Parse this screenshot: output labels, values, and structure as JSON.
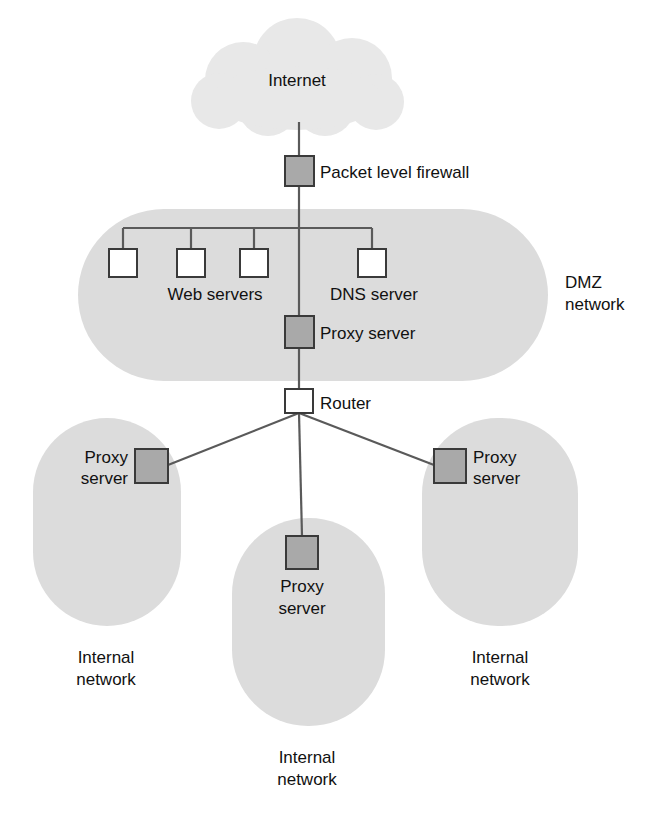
{
  "diagram": {
    "colors": {
      "zone_fill": "#dcdcdc",
      "cloud_fill": "#e8e8e8",
      "node_shaded_fill": "#a9a9a9",
      "node_white_fill": "#ffffff",
      "node_stroke": "#3a3a3a",
      "link_stroke": "#5a5a5a",
      "text": "#111111",
      "background": "#ffffff"
    },
    "nodes": {
      "internet": {
        "label": "Internet",
        "shape": "cloud",
        "fill": "light-gray"
      },
      "packet_firewall": {
        "label": "Packet level firewall",
        "shape": "square",
        "fill": "shaded"
      },
      "web_servers": {
        "label": "Web servers",
        "count": 3,
        "shape": "square",
        "fill": "white"
      },
      "dns_server": {
        "label": "DNS server",
        "count": 1,
        "shape": "square",
        "fill": "white"
      },
      "dmz_proxy": {
        "label": "Proxy server",
        "shape": "square",
        "fill": "shaded"
      },
      "router": {
        "label": "Router",
        "shape": "square",
        "fill": "white"
      },
      "left_proxy": {
        "label_line1": "Proxy",
        "label_line2": "server",
        "shape": "square",
        "fill": "shaded"
      },
      "right_proxy": {
        "label_line1": "Proxy",
        "label_line2": "server",
        "shape": "square",
        "fill": "shaded"
      },
      "center_proxy": {
        "label_line1": "Proxy",
        "label_line2": "server",
        "shape": "square",
        "fill": "shaded"
      }
    },
    "zones": {
      "dmz": {
        "label_line1": "DMZ",
        "label_line2": "network",
        "shape": "stadium-horizontal"
      },
      "internal_left": {
        "label_line1": "Internal",
        "label_line2": "network",
        "shape": "stadium-vertical"
      },
      "internal_center": {
        "label_line1": "Internal",
        "label_line2": "network",
        "shape": "stadium-vertical"
      },
      "internal_right": {
        "label_line1": "Internal",
        "label_line2": "network",
        "shape": "stadium-vertical"
      }
    },
    "connections": [
      {
        "from": "internet",
        "to": "packet_firewall"
      },
      {
        "from": "packet_firewall",
        "to": "dmz_bus"
      },
      {
        "from": "dmz_bus",
        "to": "web_server_1"
      },
      {
        "from": "dmz_bus",
        "to": "web_server_2"
      },
      {
        "from": "dmz_bus",
        "to": "web_server_3"
      },
      {
        "from": "dmz_bus",
        "to": "dns_server"
      },
      {
        "from": "dmz_bus",
        "to": "dmz_proxy"
      },
      {
        "from": "dmz_proxy",
        "to": "router"
      },
      {
        "from": "router",
        "to": "left_proxy"
      },
      {
        "from": "router",
        "to": "right_proxy"
      },
      {
        "from": "router",
        "to": "center_proxy"
      }
    ]
  }
}
